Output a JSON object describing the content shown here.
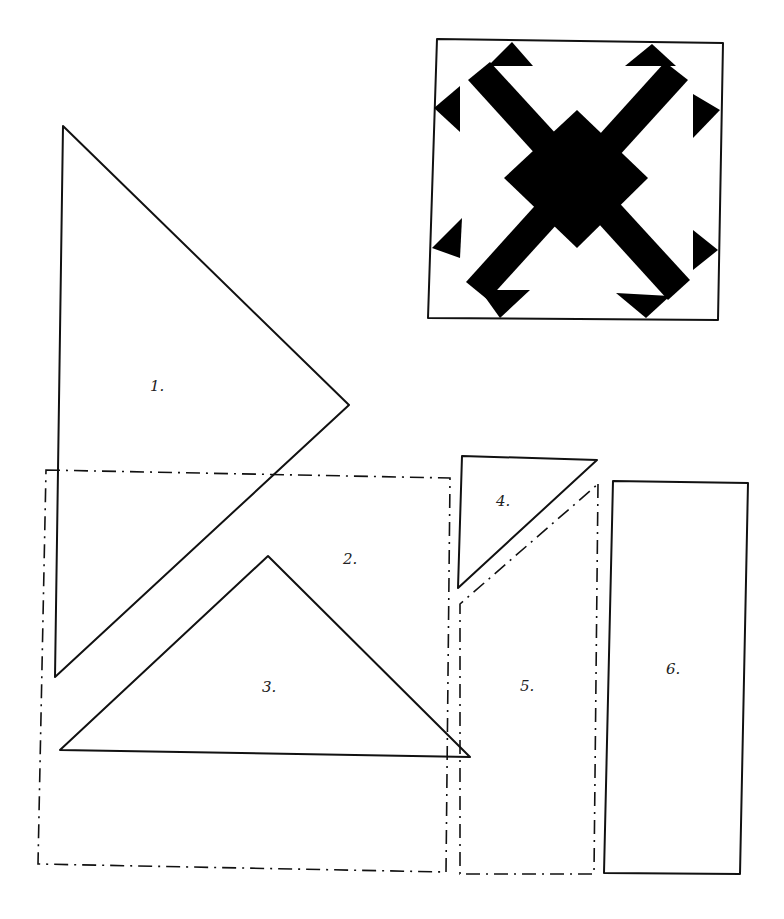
{
  "diagram": {
    "type": "quilt-block-pattern-pieces",
    "block_preview": {
      "description": "Square quilt block with black X (cross) and arrowhead triangles at each corner, central diamond",
      "fill_color": "#000000",
      "background": "#ffffff"
    },
    "pieces": [
      {
        "id": 1,
        "label": "1.",
        "shape": "right triangle",
        "outline": "solid"
      },
      {
        "id": 2,
        "label": "2.",
        "shape": "square",
        "outline": "dash-dot"
      },
      {
        "id": 3,
        "label": "3.",
        "shape": "triangle",
        "outline": "solid"
      },
      {
        "id": 4,
        "label": "4.",
        "shape": "right triangle",
        "outline": "solid"
      },
      {
        "id": 5,
        "label": "5.",
        "shape": "pentagon (rectangle with angled top)",
        "outline": "dash-dot"
      },
      {
        "id": 6,
        "label": "6.",
        "shape": "rectangle",
        "outline": "solid"
      }
    ],
    "colors": {
      "line": "#111111",
      "fill": "#000000",
      "background": "#ffffff"
    }
  }
}
